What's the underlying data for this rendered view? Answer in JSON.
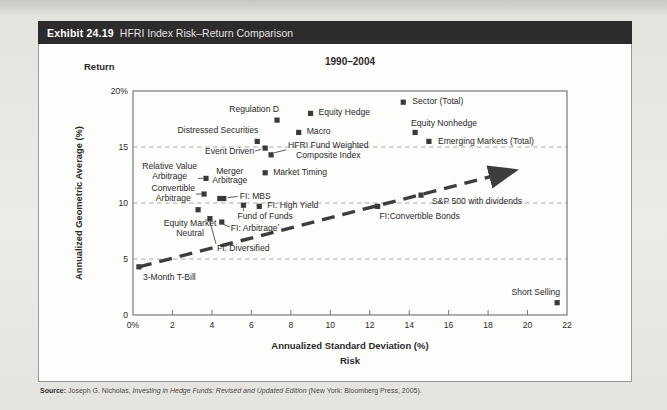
{
  "header": {
    "exhibit_label": "Exhibit 24.19",
    "title": "HFRI Index Risk–Return Comparison"
  },
  "chart_data": {
    "type": "scatter",
    "title": "1990–2004",
    "y_axis_top_label": "Return",
    "ylabel": "Annualized Geometric Average (%)",
    "xlabel": "Annualized Standard Deviation (%)",
    "x_axis_sub_label": "Risk",
    "xlim": [
      0,
      22
    ],
    "ylim": [
      0,
      20
    ],
    "grid": "dashed horizontal gridlines",
    "gridlines_y": [
      5,
      10,
      15
    ],
    "x_ticks": [
      {
        "v": 0,
        "label": "0%"
      },
      {
        "v": 2,
        "label": "2"
      },
      {
        "v": 4,
        "label": "4"
      },
      {
        "v": 6,
        "label": "6"
      },
      {
        "v": 8,
        "label": "8"
      },
      {
        "v": 10,
        "label": "10"
      },
      {
        "v": 12,
        "label": "12"
      },
      {
        "v": 14,
        "label": "14"
      },
      {
        "v": 16,
        "label": "16"
      },
      {
        "v": 18,
        "label": "18"
      },
      {
        "v": 20,
        "label": "20"
      },
      {
        "v": 22,
        "label": "22"
      }
    ],
    "y_ticks": [
      {
        "v": 0,
        "label": "0"
      },
      {
        "v": 5,
        "label": "5"
      },
      {
        "v": 10,
        "label": "10"
      },
      {
        "v": 15,
        "label": "15"
      },
      {
        "v": 20,
        "label": "20%"
      }
    ],
    "marker_color": "#3b393a",
    "grid_color": "#a0a0a0",
    "arrow_color": "#3e3c3d",
    "arrow": {
      "from": {
        "x": 0.3,
        "y": 4.3
      },
      "to": {
        "x": 18.9,
        "y": 12.7
      },
      "style": "thick dashed line with arrowhead (capital market line from T-Bill through S&P 500)"
    },
    "points": [
      {
        "name": "3-month-t-bill",
        "label": "3-Month T-Bill",
        "x": 0.3,
        "y": 4.3,
        "lx": 4,
        "ly": 6,
        "align": "left",
        "valign": "top"
      },
      {
        "name": "equity-market-neutral",
        "label": "Equity Market\nNeutral",
        "x": 3.3,
        "y": 9.4,
        "lx": -8,
        "ly": 9,
        "align": "center",
        "valign": "top",
        "inner": "center"
      },
      {
        "name": "convertible-arbitrage",
        "label": "Convertible\nArbitrage",
        "x": 3.6,
        "y": 10.8,
        "lx": -9,
        "ly": 0,
        "align": "right",
        "valign": "middle",
        "inner": "center",
        "leader": [
          -3,
          0,
          -8,
          0
        ]
      },
      {
        "name": "relative-value-arbitrage",
        "label": "Relative Value\nArbitrage",
        "x": 3.7,
        "y": 12.2,
        "lx": -9,
        "ly": -6,
        "align": "right",
        "valign": "middle",
        "inner": "center",
        "leader": [
          -3,
          0,
          -8,
          0
        ]
      },
      {
        "name": "fi-diversified",
        "label": "FI: Diversified",
        "x": 3.9,
        "y": 8.6,
        "lx": 7,
        "ly": 25,
        "align": "left",
        "valign": "top",
        "leader": [
          0,
          3,
          6,
          25
        ]
      },
      {
        "name": "merger-arbitrage",
        "label": "Merger\nArbitrage",
        "x": 4.4,
        "y": 10.4,
        "lx": 10,
        "ly": -22,
        "align": "center",
        "valign": "middle",
        "inner": "center"
      },
      {
        "name": "fi-arbitrage",
        "label": "FI: Arbitrageʼ",
        "x": 4.5,
        "y": 8.3,
        "lx": 9,
        "ly": 2,
        "align": "left",
        "valign": "top",
        "leader": [
          1,
          2,
          8,
          5
        ]
      },
      {
        "name": "fi-mbs",
        "label": "FI: MBS",
        "x": 4.6,
        "y": 10.4,
        "lx": 16,
        "ly": -2,
        "align": "left",
        "valign": "middle",
        "leader": [
          4,
          -1,
          14,
          -2
        ]
      },
      {
        "name": "fund-of-funds",
        "label": "Fund of Funds",
        "x": 5.6,
        "y": 9.8,
        "lx": -6,
        "ly": 7,
        "align": "left",
        "valign": "top",
        "leader": [
          0,
          3,
          0,
          6
        ]
      },
      {
        "name": "distressed-securities",
        "label": "Distressed Securities",
        "x": 6.3,
        "y": 15.5,
        "lx": 1,
        "ly": -5,
        "align": "right",
        "valign": "bottom"
      },
      {
        "name": "fi-high-yield",
        "label": "FI: High Yield",
        "x": 6.4,
        "y": 9.7,
        "lx": 8,
        "ly": 0,
        "align": "left",
        "valign": "middle"
      },
      {
        "name": "event-driven",
        "label": "Event Driven",
        "x": 6.7,
        "y": 14.9,
        "lx": -11,
        "ly": 4,
        "align": "right",
        "valign": "middle",
        "leader": [
          -4,
          1,
          -10,
          3
        ]
      },
      {
        "name": "market-timing",
        "label": "Market Timing",
        "x": 6.7,
        "y": 12.7,
        "lx": 8,
        "ly": 0,
        "align": "left",
        "valign": "middle"
      },
      {
        "name": "hfri-fund-weighted-composite-index",
        "label": "HFRI Fund Weighted\nComposite Index",
        "x": 7.0,
        "y": 14.3,
        "lx": 17,
        "ly": -4,
        "align": "left",
        "valign": "middle",
        "inner": "center",
        "leader": [
          3,
          -2,
          15,
          -5
        ]
      },
      {
        "name": "regulation-d",
        "label": "Regulation D",
        "x": 7.3,
        "y": 17.4,
        "lx": 2,
        "ly": -5,
        "align": "right",
        "valign": "bottom"
      },
      {
        "name": "macro",
        "label": "Macro",
        "x": 8.4,
        "y": 16.3,
        "lx": 8,
        "ly": 0,
        "align": "left",
        "valign": "middle"
      },
      {
        "name": "equity-hedge",
        "label": "Equity Hedge",
        "x": 9.0,
        "y": 18.0,
        "lx": 8,
        "ly": 0,
        "align": "left",
        "valign": "middle"
      },
      {
        "name": "fi-convertible-bonds",
        "label": "FI:Convertible Bonds",
        "x": 12.4,
        "y": 9.7,
        "lx": 2,
        "ly": 6,
        "align": "left",
        "valign": "top"
      },
      {
        "name": "sector-total",
        "label": "Sector (Total)",
        "x": 13.7,
        "y": 19.0,
        "lx": 9,
        "ly": 0,
        "align": "left",
        "valign": "middle"
      },
      {
        "name": "equity-nonhedge",
        "label": "Equity Nonhedge",
        "x": 14.3,
        "y": 16.3,
        "lx": -4,
        "ly": -3,
        "align": "left",
        "valign": "bottom"
      },
      {
        "name": "sp500-with-dividends",
        "label": "S&P 500 with dividends",
        "x": 14.6,
        "y": 10.7,
        "lx": 11,
        "ly": 2,
        "align": "left",
        "valign": "top"
      },
      {
        "name": "emerging-markets-total",
        "label": "Emerging Markets (Total)",
        "x": 15.0,
        "y": 15.5,
        "lx": 9,
        "ly": 1,
        "align": "left",
        "valign": "middle"
      },
      {
        "name": "short-selling",
        "label": "Short Selling",
        "x": 21.5,
        "y": 1.1,
        "lx": 3,
        "ly": -5,
        "align": "right",
        "valign": "bottom"
      }
    ]
  },
  "source": {
    "label": "Source:",
    "before_italic": " Joseph G. Nicholas, ",
    "italic": "Investing in Hedge Funds: Revised and Updated Edition",
    "after_italic": " (New York: Bloomberg Press, 2005)."
  }
}
